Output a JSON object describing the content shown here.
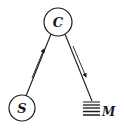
{
  "diagram": {
    "nodes": [
      {
        "id": "C",
        "label": "C",
        "shape": "circle",
        "cx": 58,
        "cy": 22,
        "r": 14
      },
      {
        "id": "S",
        "label": "S",
        "shape": "circle",
        "cx": 22,
        "cy": 108,
        "r": 13
      },
      {
        "id": "M",
        "label": "M",
        "shape": "stacked-lines"
      }
    ],
    "edges": [
      {
        "from": "S",
        "to": "C",
        "arrow_direction": "toward C"
      },
      {
        "from": "C",
        "to": "M",
        "arrow_direction": "toward M"
      }
    ],
    "colors": {
      "stroke": "#1a1a1a",
      "background": "#ffffff"
    }
  }
}
